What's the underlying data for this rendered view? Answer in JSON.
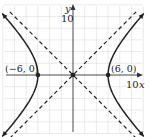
{
  "chart_data": {
    "type": "line",
    "title": "",
    "xlabel": "x",
    "ylabel": "y",
    "xlim": [
      -12,
      12
    ],
    "ylim": [
      -12,
      12
    ],
    "grid": true,
    "grid_step": 2,
    "ticks": {
      "x_label": "10",
      "y_label": "10"
    },
    "equation": "x^2/36 - y^2/36 = 1",
    "asymptotes": [
      "y = x",
      "y = -x"
    ],
    "points": [
      {
        "label": "(-6, 0)",
        "x": -6,
        "y": 0
      },
      {
        "label": "(6, 0)",
        "x": 6,
        "y": 0
      },
      {
        "label": "",
        "x": 0,
        "y": 0
      }
    ]
  },
  "labels": {
    "x_axis": "x",
    "y_axis": "y",
    "x_tick": "10",
    "y_tick": "10",
    "left_vertex": "(−6, 0)",
    "right_vertex": "(6, 0)"
  }
}
